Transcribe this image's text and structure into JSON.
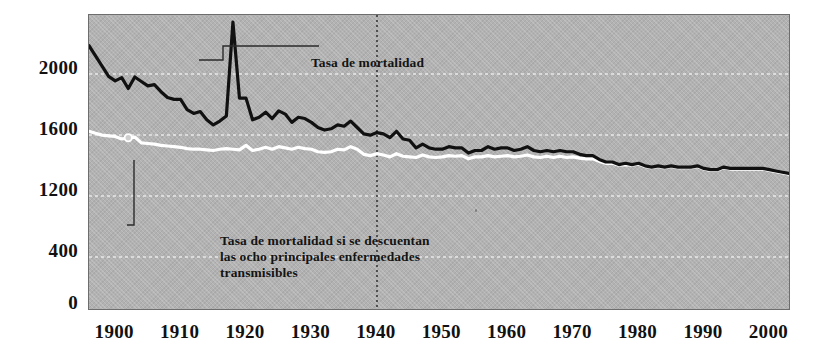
{
  "chart_data": {
    "type": "line",
    "title": "",
    "xlabel": "",
    "ylabel": "",
    "xlim": [
      1896,
      2003
    ],
    "ylim": [
      0,
      2300
    ],
    "grid": true,
    "grid_style": "dotted white horizontal gridlines",
    "legend_position": "inline annotations",
    "background_color": "#b2b2b2",
    "x_ticks": [
      1900,
      1910,
      1920,
      1930,
      1940,
      1950,
      1960,
      1970,
      1980,
      1990,
      2000
    ],
    "x_tick_labels": [
      "1900",
      "1910",
      "1920",
      "1930",
      "1940",
      "1950",
      "1960",
      "1970",
      "1980",
      "1990",
      "2000"
    ],
    "y_ticks": [
      0,
      800,
      1200,
      1600,
      2000
    ],
    "y_tick_labels": [
      "0",
      "400",
      "1200",
      "1600",
      "2000"
    ],
    "y_tick_note": "Third label from bottom is printed as 400 in the original where 800 would be expected",
    "vertical_reference_line": {
      "x": 1940,
      "style": "dotted",
      "color": "#2b2b2b"
    },
    "marker": {
      "series": "Tasa de mortalidad si se descuentan las ocho principales enfermedades transmisibles",
      "x": 1902,
      "y": 1340,
      "shape": "open-circle",
      "color": "#ffffff"
    },
    "annotations": [
      {
        "name": "tasa-de-mortalidad",
        "text": "Tasa de mortalidad",
        "x": 1913,
        "y": 2000,
        "leader": "elbow"
      },
      {
        "name": "tasa-descontadas",
        "text": "Tasa de mortalidad si se descuentan\nlas ocho principales enfermedades\ntransmisibles",
        "x": 1902,
        "y": 760,
        "leader": "elbow"
      }
    ],
    "series": [
      {
        "name": "Tasa de mortalidad",
        "color": "#111111",
        "linewidth": 3.2,
        "x": [
          1896,
          1897,
          1898,
          1899,
          1900,
          1901,
          1902,
          1903,
          1904,
          1905,
          1906,
          1907,
          1908,
          1909,
          1910,
          1911,
          1912,
          1913,
          1914,
          1915,
          1916,
          1917,
          1918,
          1919,
          1920,
          1921,
          1922,
          1923,
          1924,
          1925,
          1926,
          1927,
          1928,
          1929,
          1930,
          1931,
          1932,
          1933,
          1934,
          1935,
          1936,
          1937,
          1938,
          1939,
          1940,
          1941,
          1942,
          1943,
          1944,
          1945,
          1946,
          1947,
          1948,
          1949,
          1950,
          1951,
          1952,
          1953,
          1954,
          1955,
          1956,
          1957,
          1958,
          1959,
          1960,
          1961,
          1962,
          1963,
          1964,
          1965,
          1966,
          1967,
          1968,
          1969,
          1970,
          1971,
          1972,
          1973,
          1974,
          1975,
          1976,
          1977,
          1978,
          1979,
          1980,
          1981,
          1982,
          1983,
          1984,
          1985,
          1986,
          1987,
          1988,
          1989,
          1990,
          1991,
          1992,
          1993,
          1994,
          1995,
          1996,
          1997,
          1998,
          1999,
          2000,
          2001,
          2002,
          2003
        ],
        "y": [
          2060,
          1980,
          1900,
          1820,
          1785,
          1810,
          1725,
          1815,
          1780,
          1745,
          1755,
          1700,
          1655,
          1640,
          1640,
          1560,
          1530,
          1545,
          1480,
          1440,
          1470,
          1510,
          2245,
          1650,
          1650,
          1480,
          1500,
          1540,
          1490,
          1550,
          1525,
          1460,
          1500,
          1490,
          1460,
          1420,
          1400,
          1410,
          1440,
          1430,
          1470,
          1420,
          1370,
          1360,
          1380,
          1370,
          1340,
          1390,
          1330,
          1320,
          1260,
          1290,
          1260,
          1250,
          1250,
          1270,
          1260,
          1260,
          1220,
          1240,
          1240,
          1270,
          1250,
          1260,
          1260,
          1240,
          1250,
          1270,
          1240,
          1230,
          1240,
          1230,
          1240,
          1230,
          1230,
          1210,
          1200,
          1200,
          1170,
          1150,
          1150,
          1130,
          1140,
          1130,
          1140,
          1120,
          1110,
          1120,
          1110,
          1120,
          1110,
          1110,
          1110,
          1120,
          1100,
          1090,
          1090,
          1110,
          1100,
          1100,
          1100,
          1100,
          1100,
          1100,
          1090,
          1080,
          1070,
          1060
        ]
      },
      {
        "name": "Tasa de mortalidad si se descuentan las ocho principales enfermedades transmisibles",
        "color": "#ffffff",
        "linewidth": 3.2,
        "x": [
          1896,
          1897,
          1898,
          1899,
          1900,
          1901,
          1902,
          1903,
          1904,
          1905,
          1906,
          1907,
          1908,
          1909,
          1910,
          1911,
          1912,
          1913,
          1914,
          1915,
          1916,
          1917,
          1918,
          1919,
          1920,
          1921,
          1922,
          1923,
          1924,
          1925,
          1926,
          1927,
          1928,
          1929,
          1930,
          1931,
          1932,
          1933,
          1934,
          1935,
          1936,
          1937,
          1938,
          1939,
          1940,
          1941,
          1942,
          1943,
          1944,
          1945,
          1946,
          1947,
          1948,
          1949,
          1950,
          1951,
          1952,
          1953,
          1954,
          1955,
          1956,
          1957,
          1958,
          1959,
          1960,
          1961,
          1962,
          1963,
          1964,
          1965,
          1966,
          1967,
          1968,
          1969,
          1970,
          1971,
          1972,
          1973,
          1974,
          1975,
          1976,
          1977,
          1978,
          1979,
          1980,
          1981,
          1982,
          1983,
          1984,
          1985,
          1986,
          1987,
          1988,
          1989,
          1990,
          1991,
          1992,
          1993,
          1994,
          1995,
          1996,
          1997,
          1998,
          1999,
          2000,
          2001,
          2002,
          2003
        ],
        "y": [
          1390,
          1375,
          1360,
          1355,
          1350,
          1330,
          1340,
          1345,
          1300,
          1295,
          1290,
          1280,
          1275,
          1270,
          1265,
          1255,
          1250,
          1250,
          1245,
          1240,
          1250,
          1255,
          1250,
          1245,
          1280,
          1240,
          1250,
          1265,
          1250,
          1270,
          1260,
          1250,
          1265,
          1255,
          1250,
          1230,
          1225,
          1230,
          1250,
          1245,
          1270,
          1250,
          1210,
          1200,
          1215,
          1205,
          1190,
          1215,
          1195,
          1190,
          1185,
          1205,
          1190,
          1185,
          1190,
          1200,
          1195,
          1200,
          1175,
          1190,
          1190,
          1200,
          1190,
          1195,
          1200,
          1190,
          1195,
          1205,
          1190,
          1185,
          1195,
          1185,
          1195,
          1185,
          1190,
          1180,
          1175,
          1175,
          1155,
          1140,
          1140,
          1125,
          1130,
          1125,
          1135,
          1115,
          1105,
          1115,
          1105,
          1115,
          1105,
          1105,
          1105,
          1115,
          1095,
          1085,
          1085,
          1105,
          1095,
          1095,
          1095,
          1095,
          1095,
          1095,
          1085,
          1075,
          1065,
          1055
        ]
      }
    ]
  }
}
